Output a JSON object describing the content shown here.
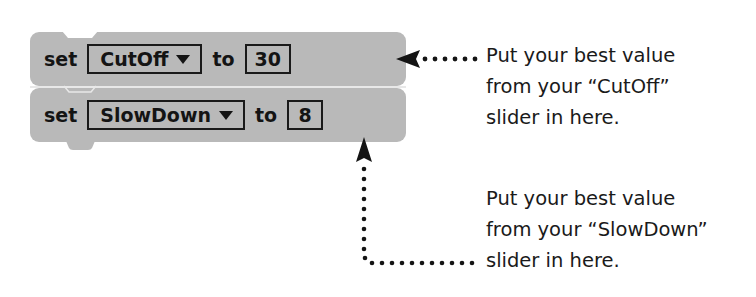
{
  "blocks": [
    {
      "keyword": "set",
      "variable": "CutOff",
      "connector": "to",
      "value": "30"
    },
    {
      "keyword": "set",
      "variable": "SlowDown",
      "connector": "to",
      "value": "8"
    }
  ],
  "annotations": [
    {
      "lines": [
        "Put your best value",
        "from your “CutOff”",
        "slider in here."
      ]
    },
    {
      "lines": [
        "Put your best value",
        "from your “SlowDown”",
        "slider in here."
      ]
    }
  ],
  "colors": {
    "block": "#b9b9b9",
    "ink": "#1a1a1a",
    "background": "#ffffff"
  }
}
